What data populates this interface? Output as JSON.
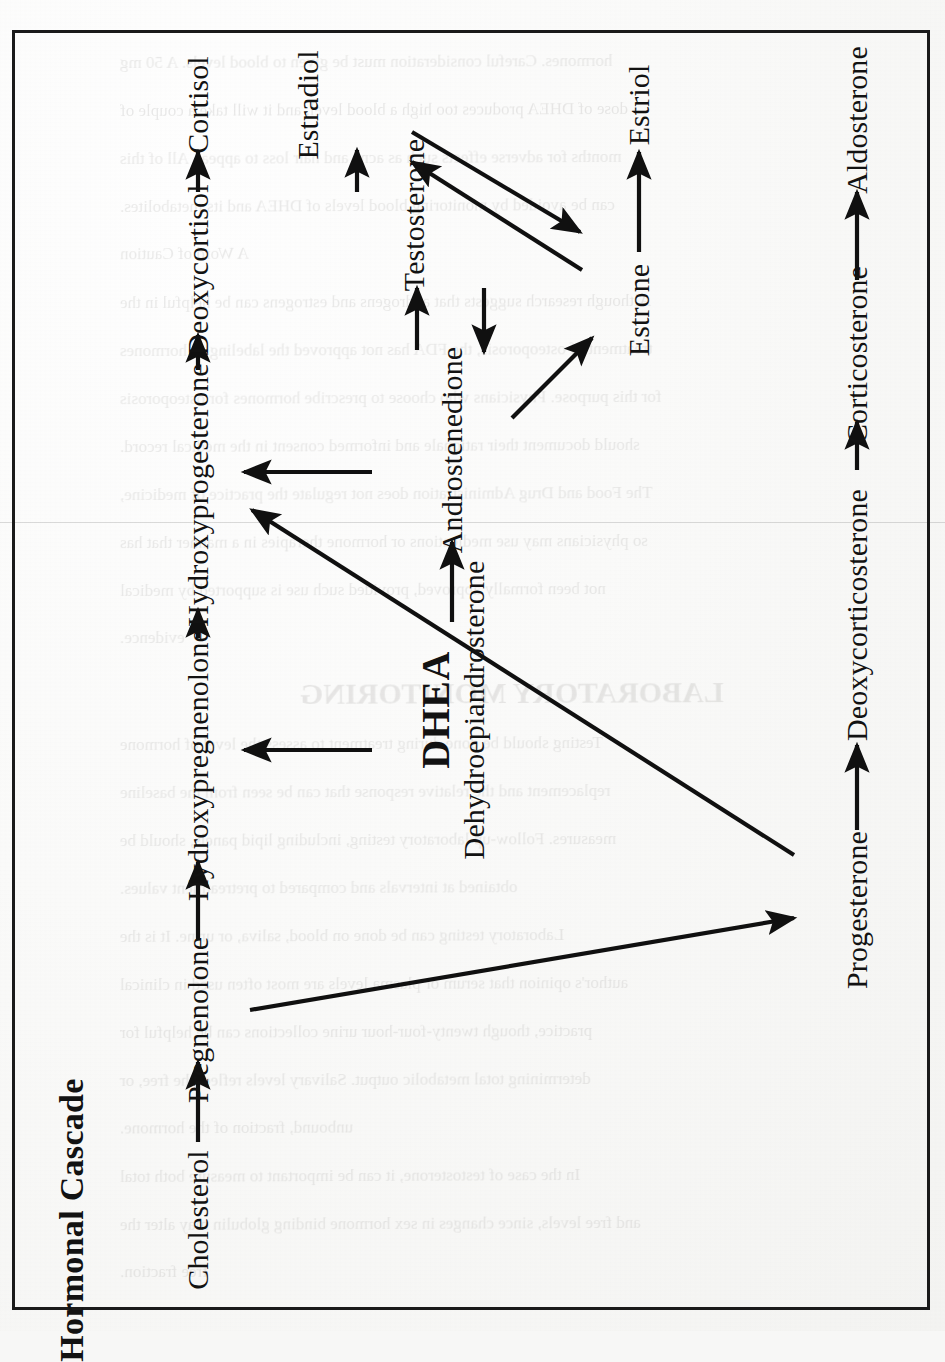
{
  "document": {
    "type": "scanned-book-page",
    "orientation": "rotated-90-clockwise",
    "paper_color": "#fafaf8",
    "ink_color": "#121212",
    "frame": {
      "border_color": "#1a1a1a",
      "border_width_px": 3
    }
  },
  "figure": {
    "title": "Hormonal Cascade",
    "nodes": [
      {
        "id": "cholesterol",
        "label": "Cholesterol"
      },
      {
        "id": "pregnenolone",
        "label": "Pregnenolone"
      },
      {
        "id": "hydroxypregnenolone",
        "label": "Hydroxypregnenolone"
      },
      {
        "id": "hydroxyprogesterone",
        "label": "Hydroxyprogesterone"
      },
      {
        "id": "deoxycortisol",
        "label": "Deoxycortisol"
      },
      {
        "id": "cortisol",
        "label": "Cortisol"
      },
      {
        "id": "progesterone",
        "label": "Progesterone"
      },
      {
        "id": "deoxycorticosterone",
        "label": "Deoxycorticosterone"
      },
      {
        "id": "corticosterone",
        "label": "Corticosterone"
      },
      {
        "id": "aldosterone",
        "label": "Aldosterone"
      },
      {
        "id": "dhea",
        "abbrev": "DHEA",
        "label": "Dehydroepiandrosterone"
      },
      {
        "id": "androstenedione",
        "label": "Androstenedione"
      },
      {
        "id": "testosterone",
        "label": "Testosterone"
      },
      {
        "id": "estradiol",
        "label": "Estradiol"
      },
      {
        "id": "estrone",
        "label": "Estrone"
      },
      {
        "id": "estriol",
        "label": "Estriol"
      }
    ],
    "edges": [
      {
        "from": "cholesterol",
        "to": "pregnenolone",
        "style": "straight"
      },
      {
        "from": "pregnenolone",
        "to": "hydroxypregnenolone",
        "style": "straight"
      },
      {
        "from": "hydroxypregnenolone",
        "to": "hydroxyprogesterone",
        "style": "straight"
      },
      {
        "from": "hydroxyprogesterone",
        "to": "deoxycortisol",
        "style": "straight"
      },
      {
        "from": "deoxycortisol",
        "to": "cortisol",
        "style": "straight"
      },
      {
        "from": "pregnenolone",
        "to": "progesterone",
        "style": "diagonal"
      },
      {
        "from": "progesterone",
        "to": "hydroxyprogesterone",
        "style": "diagonal"
      },
      {
        "from": "progesterone",
        "to": "deoxycorticosterone",
        "style": "straight"
      },
      {
        "from": "deoxycorticosterone",
        "to": "corticosterone",
        "style": "straight"
      },
      {
        "from": "corticosterone",
        "to": "aldosterone",
        "style": "straight"
      },
      {
        "from": "hydroxypregnenolone",
        "to": "dhea",
        "style": "straight"
      },
      {
        "from": "dhea",
        "to": "androstenedione",
        "style": "straight"
      },
      {
        "from": "hydroxyprogesterone",
        "to": "androstenedione",
        "style": "straight"
      },
      {
        "from": "androstenedione",
        "to": "testosterone",
        "style": "straight"
      },
      {
        "from": "testosterone",
        "to": "androstenedione",
        "style": "straight"
      },
      {
        "from": "testosterone",
        "to": "estradiol",
        "style": "straight"
      },
      {
        "from": "androstenedione",
        "to": "estrone",
        "style": "diagonal"
      },
      {
        "from": "estrone",
        "to": "estradiol",
        "style": "diagonal"
      },
      {
        "from": "estradiol",
        "to": "estrone",
        "style": "diagonal"
      },
      {
        "from": "estrone",
        "to": "estriol",
        "style": "straight"
      }
    ]
  },
  "bleed_through": {
    "note": "faint mirrored text showing through from the reverse side of the sheet",
    "lines": [
      "hormones. Careful consideration must be given to blood levels. A 50 mg",
      "dose of DHEA produces too high a blood level, and it will take a couple of",
      "months for adverse effects such as acne and hair loss to appear. All of this",
      "can be avoided by monitoring blood levels of DHEA and its metabolites.",
      "A Word of Caution",
      "Although research suggests that androgens and estrogens can be helpful in the",
      "treatment of osteoporosis, the FDA has not approved the labeling of hormones",
      "for this purpose. Physicians who choose to prescribe hormones for osteoporosis",
      "should document their rationale and informed consent in the medical record.",
      "The Food and Drug Administration does not regulate the practice of medicine,",
      "so physicians may use medications or hormone therapies in a manner that has",
      "not been formally approved, provided such use is supported by medical",
      "evidence.",
      "LABORATORY MONITORING",
      "Testing should be done during treatment to assess the level of hormone",
      "replacement and the relative response that can be seen from the baseline",
      "measures. Follow-up laboratory testing, including lipid panels, should be",
      "obtained at intervals and compared to pretreatment values.",
      "Laboratory testing can be done on blood, saliva, or urine. It is the",
      "author's opinion that serum or plasma levels are most often used in clinical",
      "practice, though twenty-four-hour urine collections can be helpful for",
      "determining total metabolic output. Salivary levels reflect the free, or",
      "unbound, fraction of the hormone.",
      "In the case of testosterone, it can be important to measure both total",
      "and free levels, since changes in sex hormone binding globulin may alter the",
      "free fraction."
    ]
  }
}
